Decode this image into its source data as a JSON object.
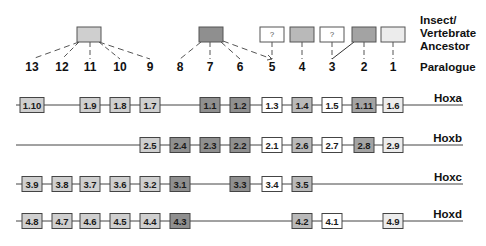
{
  "legend": {
    "ancestor_label_lines": [
      "Insect/",
      "Vertebrate",
      "Ancestor"
    ],
    "paralogue_label": "Paralogue"
  },
  "paralogue_numbers": [
    "13",
    "12",
    "11",
    "10",
    "9",
    "8",
    "7",
    "6",
    "5",
    "4",
    "3",
    "2",
    "1"
  ],
  "shade_colors": {
    "dark": "#8f8f8f",
    "darkmid": "#a3a3a3",
    "medium": "#b9b9b9",
    "light": "#cfcfcf",
    "pale": "#ececec",
    "white": "#ffffff"
  },
  "ancestors": [
    {
      "id": "anc-13-9",
      "paralogues": [
        "13",
        "12",
        "11",
        "10",
        "9"
      ],
      "shade": "light",
      "label": ""
    },
    {
      "id": "anc-8-6",
      "paralogues": [
        "8",
        "7",
        "6"
      ],
      "dashed_extra": [
        "5"
      ],
      "shade": "dark",
      "label": ""
    },
    {
      "id": "anc-5",
      "paralogues": [
        "5"
      ],
      "shade": "white",
      "label": "?"
    },
    {
      "id": "anc-4",
      "paralogues": [
        "4"
      ],
      "shade": "medium",
      "label": ""
    },
    {
      "id": "anc-3",
      "paralogues": [
        "3"
      ],
      "shade": "white",
      "label": "?"
    },
    {
      "id": "anc-2",
      "paralogues": [
        "2"
      ],
      "solid_extra": [
        "3"
      ],
      "shade": "darkmid",
      "label": ""
    },
    {
      "id": "anc-1",
      "paralogues": [
        "1"
      ],
      "shade": "pale",
      "label": ""
    }
  ],
  "clusters": [
    {
      "name": "Hoxa",
      "genes": [
        {
          "label": "1.10",
          "paralogue": "13",
          "shade": "light"
        },
        {
          "label": "1.9",
          "paralogue": "11",
          "shade": "light"
        },
        {
          "label": "1.8",
          "paralogue": "10",
          "shade": "light"
        },
        {
          "label": "1.7",
          "paralogue": "9",
          "shade": "light"
        },
        {
          "label": "1.1",
          "paralogue": "7",
          "shade": "dark"
        },
        {
          "label": "1.2",
          "paralogue": "6",
          "shade": "dark"
        },
        {
          "label": "1.3",
          "paralogue": "5",
          "shade": "white"
        },
        {
          "label": "1.4",
          "paralogue": "4",
          "shade": "medium"
        },
        {
          "label": "1.5",
          "paralogue": "3",
          "shade": "white"
        },
        {
          "label": "1.11",
          "paralogue": "2",
          "shade": "darkmid"
        },
        {
          "label": "1.6",
          "paralogue": "1",
          "shade": "pale"
        }
      ]
    },
    {
      "name": "Hoxb",
      "genes": [
        {
          "label": "2.5",
          "paralogue": "9",
          "shade": "light"
        },
        {
          "label": "2.4",
          "paralogue": "8",
          "shade": "dark"
        },
        {
          "label": "2.3",
          "paralogue": "7",
          "shade": "dark"
        },
        {
          "label": "2.2",
          "paralogue": "6",
          "shade": "dark"
        },
        {
          "label": "2.1",
          "paralogue": "5",
          "shade": "white"
        },
        {
          "label": "2.6",
          "paralogue": "4",
          "shade": "medium"
        },
        {
          "label": "2.7",
          "paralogue": "3",
          "shade": "white"
        },
        {
          "label": "2.8",
          "paralogue": "2",
          "shade": "darkmid"
        },
        {
          "label": "2.9",
          "paralogue": "1",
          "shade": "pale"
        }
      ]
    },
    {
      "name": "Hoxc",
      "genes": [
        {
          "label": "3.9",
          "paralogue": "13",
          "shade": "light"
        },
        {
          "label": "3.8",
          "paralogue": "12",
          "shade": "light"
        },
        {
          "label": "3.7",
          "paralogue": "11",
          "shade": "light"
        },
        {
          "label": "3.6",
          "paralogue": "10",
          "shade": "light"
        },
        {
          "label": "3.2",
          "paralogue": "9",
          "shade": "light"
        },
        {
          "label": "3.1",
          "paralogue": "8",
          "shade": "dark"
        },
        {
          "label": "3.3",
          "paralogue": "6",
          "shade": "dark"
        },
        {
          "label": "3.4",
          "paralogue": "5",
          "shade": "white"
        },
        {
          "label": "3.5",
          "paralogue": "4",
          "shade": "medium"
        }
      ]
    },
    {
      "name": "Hoxd",
      "genes": [
        {
          "label": "4.8",
          "paralogue": "13",
          "shade": "light"
        },
        {
          "label": "4.7",
          "paralogue": "12",
          "shade": "light"
        },
        {
          "label": "4.6",
          "paralogue": "11",
          "shade": "light"
        },
        {
          "label": "4.5",
          "paralogue": "10",
          "shade": "light"
        },
        {
          "label": "4.4",
          "paralogue": "9",
          "shade": "light"
        },
        {
          "label": "4.3",
          "paralogue": "8",
          "shade": "dark"
        },
        {
          "label": "4.2",
          "paralogue": "4",
          "shade": "medium"
        },
        {
          "label": "4.1",
          "paralogue": "3",
          "shade": "white"
        },
        {
          "label": "4.9",
          "paralogue": "1",
          "shade": "pale"
        }
      ]
    }
  ]
}
